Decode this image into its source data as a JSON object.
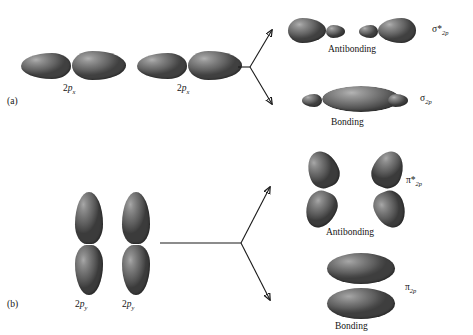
{
  "figure": {
    "type": "molecular-orbital-diagram",
    "background_color": "#ffffff",
    "orbital_color": "#6e6e6e"
  },
  "panels": [
    {
      "tag": "(a)",
      "interaction": "sigma",
      "atomic_orbitals": [
        {
          "label_base": "2p",
          "label_sub": "x",
          "shape": "horizontal-dumbbell"
        },
        {
          "label_base": "2p",
          "label_sub": "x",
          "shape": "horizontal-dumbbell"
        }
      ],
      "results": [
        {
          "state": "Antibonding",
          "mo_base": "σ",
          "mo_star": "*",
          "mo_sub": "2p",
          "shape": "four-lobe-horizontal"
        },
        {
          "state": "Bonding",
          "mo_base": "σ",
          "mo_star": "",
          "mo_sub": "2p",
          "shape": "lens-with-small-end-lobes"
        }
      ]
    },
    {
      "tag": "(b)",
      "interaction": "pi",
      "atomic_orbitals": [
        {
          "label_base": "2p",
          "label_sub": "y",
          "shape": "vertical-dumbbell"
        },
        {
          "label_base": "2p",
          "label_sub": "y",
          "shape": "vertical-dumbbell"
        }
      ],
      "results": [
        {
          "state": "Antibonding",
          "mo_base": "π",
          "mo_star": "*",
          "mo_sub": "2p",
          "shape": "four-separated-lobes"
        },
        {
          "state": "Bonding",
          "mo_base": "π",
          "mo_star": "",
          "mo_sub": "2p",
          "shape": "two-stacked-ellipses"
        }
      ]
    }
  ],
  "labels": {
    "panel_a_tag": "(a)",
    "panel_b_tag": "(b)",
    "a_ao_1_num": "2",
    "a_ao_1_p": "p",
    "a_ao_1_sub": "x",
    "a_ao_2_num": "2",
    "a_ao_2_p": "p",
    "a_ao_2_sub": "x",
    "b_ao_1_num": "2",
    "b_ao_1_p": "p",
    "b_ao_1_sub": "y",
    "b_ao_2_num": "2",
    "b_ao_2_p": "p",
    "b_ao_2_sub": "y",
    "a_anti_state": "Antibonding",
    "a_bond_state": "Bonding",
    "b_anti_state": "Antibonding",
    "b_bond_state": "Bonding",
    "sigma_star_sym": "σ",
    "sigma_star_mark": "*",
    "sigma_star_sub": "2p",
    "sigma_sym": "σ",
    "sigma_sub": "2p",
    "pi_star_sym": "π",
    "pi_star_mark": "*",
    "pi_star_sub": "2p",
    "pi_sym": "π",
    "pi_sub": "2p"
  }
}
